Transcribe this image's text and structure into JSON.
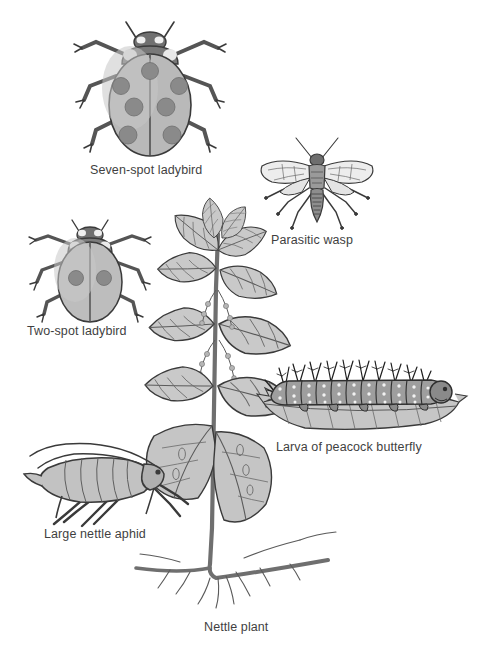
{
  "figure": {
    "title_present": false,
    "background_color": "#ffffff",
    "label_color": "#3f3f3f"
  },
  "palette": {
    "outline": "#3a3a3a",
    "body_light": "#cccccc",
    "body_mid": "#b4b4b4",
    "body_dark": "#8c8c8c",
    "body_darker": "#6e6e6e",
    "spot": "#8a8a8a",
    "highlight": "#e8e8e8",
    "leaf_fill": "#c9c9c9",
    "stem": "#7a7a7a"
  },
  "organisms": [
    {
      "id": "seven-spot-ladybird",
      "label": "Seven-spot ladybird",
      "label_x": 160,
      "label_y": 171,
      "spot_count": 7,
      "view": "dorsal"
    },
    {
      "id": "parasitic-wasp",
      "label": "Parasitic wasp",
      "label_x": 313,
      "label_y": 241,
      "wing_count": 4,
      "view": "dorsal"
    },
    {
      "id": "two-spot-ladybird",
      "label": "Two-spot ladybird",
      "label_x": 88,
      "label_y": 332,
      "spot_count": 2,
      "view": "dorsal"
    },
    {
      "id": "larva-peacock-butterfly",
      "label": "Larva of peacock butterfly",
      "label_x": 355,
      "label_y": 448,
      "segment_count": 11,
      "view": "lateral"
    },
    {
      "id": "large-nettle-aphid",
      "label": "Large nettle aphid",
      "label_x": 99,
      "label_y": 535,
      "view": "lateral"
    },
    {
      "id": "nettle-plant",
      "label": "Nettle plant",
      "label_x": 240,
      "label_y": 628,
      "view": "whole-plant-with-roots"
    }
  ]
}
